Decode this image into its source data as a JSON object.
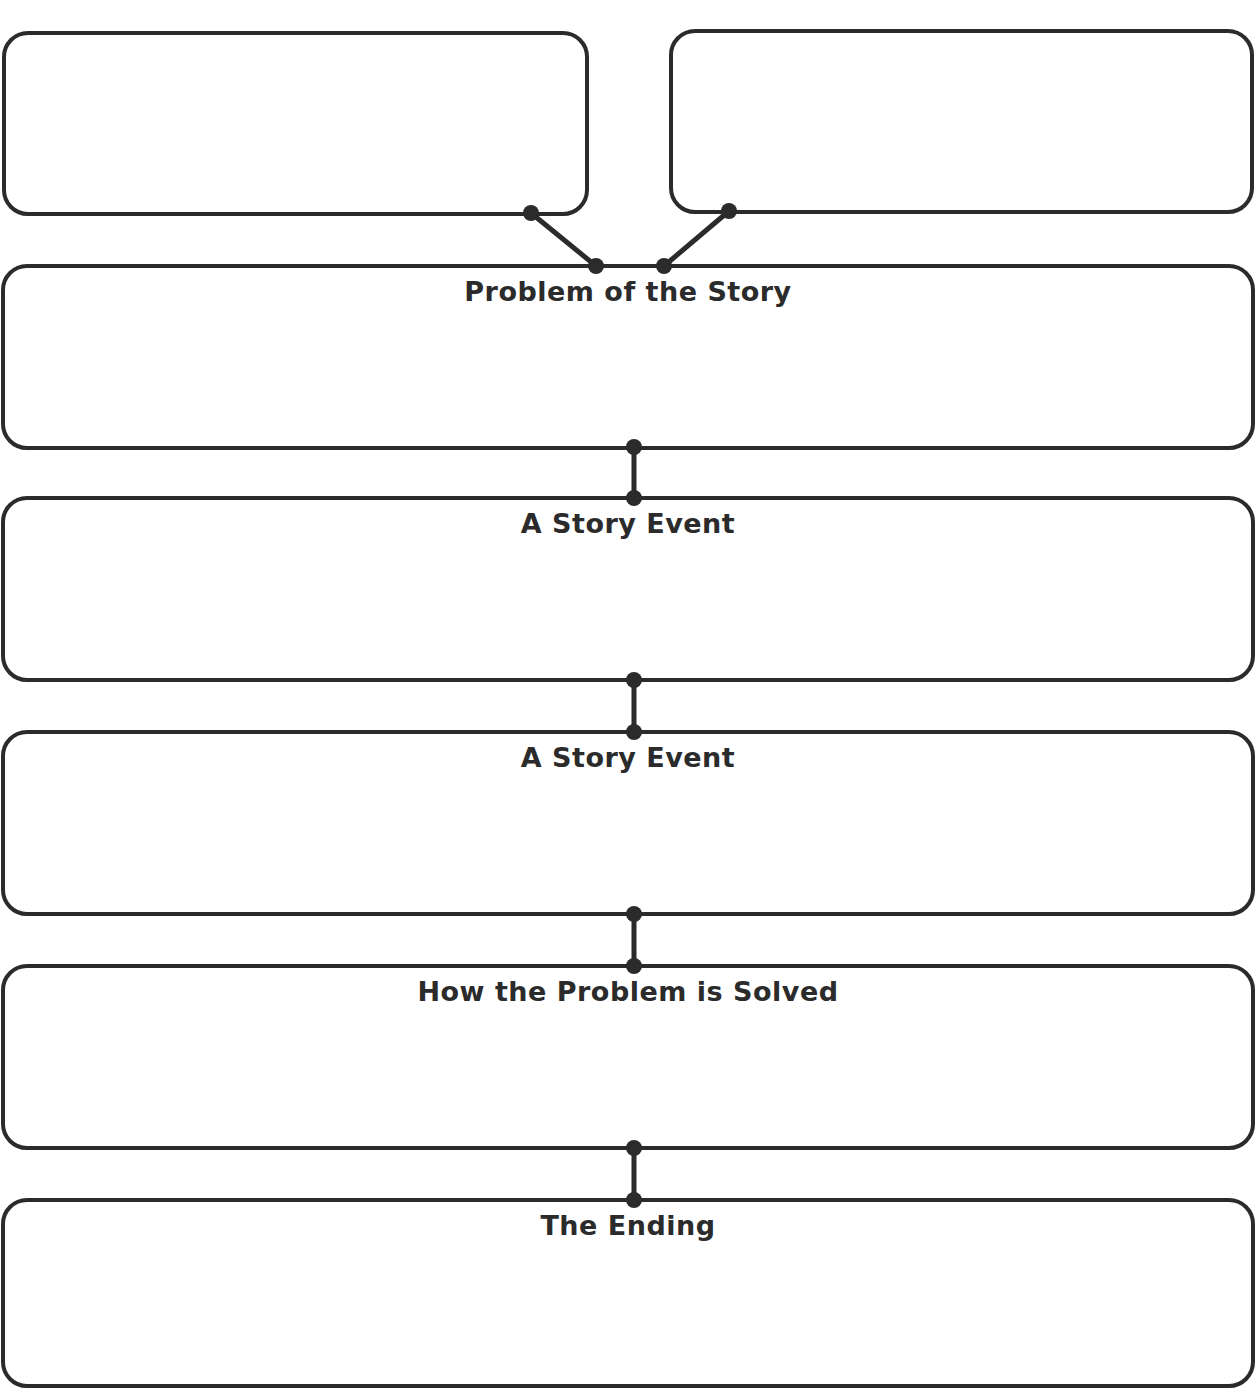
{
  "diagram": {
    "type": "story-map-graphic-organizer",
    "top_boxes": [
      {
        "id": "top-left",
        "label": ""
      },
      {
        "id": "top-right",
        "label": ""
      }
    ],
    "sections": [
      {
        "id": "problem",
        "label": "Problem of the Story"
      },
      {
        "id": "event-1",
        "label": "A Story Event"
      },
      {
        "id": "event-2",
        "label": "A Story Event"
      },
      {
        "id": "solution",
        "label": "How the Problem is Solved"
      },
      {
        "id": "ending",
        "label": "The Ending"
      }
    ],
    "colors": {
      "stroke": "#2b2b2b",
      "background": "#ffffff"
    }
  }
}
